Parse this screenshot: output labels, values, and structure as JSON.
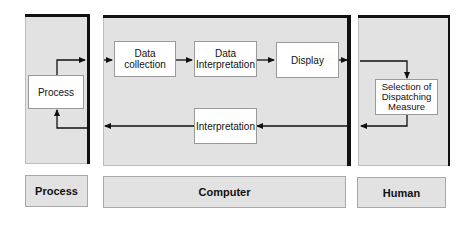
{
  "colors": {
    "panel_fill": "#e2e2e2",
    "node_fill": "#ffffff",
    "line": "#111111"
  },
  "panels": {
    "process": {
      "label": "Process"
    },
    "computer": {
      "label": "Computer"
    },
    "human": {
      "label": "Human"
    }
  },
  "nodes": {
    "process": "Process",
    "data_collection_line1": "Data",
    "data_collection_line2": "collection",
    "data_interpretation_line1": "Data",
    "data_interpretation_line2": "Interpretation",
    "display": "Display",
    "interpretation": "Interpretation",
    "selection_line1": "Selection of",
    "selection_line2": "Dispatching",
    "selection_line3": "Measure"
  },
  "edges": [
    {
      "from": "Process",
      "to": "Data collection"
    },
    {
      "from": "Data collection",
      "to": "Data Interpretation"
    },
    {
      "from": "Data Interpretation",
      "to": "Display"
    },
    {
      "from": "Display",
      "to": "Selection of Dispatching Measure"
    },
    {
      "from": "Selection of Dispatching Measure",
      "to": "Interpretation"
    },
    {
      "from": "Interpretation",
      "to": "Process"
    }
  ]
}
